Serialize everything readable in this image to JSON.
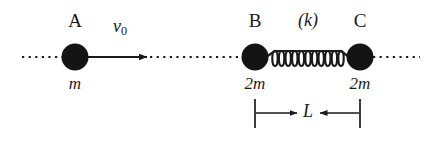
{
  "figure": {
    "type": "physics-mechanics-diagram",
    "background_color": "#ffffff",
    "ink_color": "#1a1a1a"
  },
  "bodies": [
    {
      "id": "A",
      "name_label": "A",
      "mass_label": "m",
      "cx": 75,
      "cy": 57,
      "r": 13,
      "name_x": 75,
      "name_y": 20,
      "mass_x": 75,
      "mass_y": 82
    },
    {
      "id": "B",
      "name_label": "B",
      "mass_label": "2m",
      "cx": 255,
      "cy": 57,
      "r": 13,
      "name_x": 255,
      "name_y": 20,
      "mass_x": 255,
      "mass_y": 82
    },
    {
      "id": "C",
      "name_label": "C",
      "mass_label": "2m",
      "cx": 360,
      "cy": 57,
      "r": 13,
      "name_x": 360,
      "name_y": 20,
      "mass_x": 360,
      "mass_y": 82
    }
  ],
  "velocity": {
    "symbol": "v",
    "subscript": "0",
    "label_x": 120,
    "label_y": 26,
    "arrow_start_x": 88,
    "arrow_end_x": 148,
    "arrow_y": 57
  },
  "spring": {
    "label": "(k)",
    "label_x": 308,
    "label_y": 20,
    "start_x": 268,
    "end_x": 347,
    "y": 57,
    "coils": 11,
    "amplitude": 8
  },
  "axis": {
    "y": 57,
    "left_x": 22,
    "right_x": 420,
    "style": "dotted"
  },
  "dimension": {
    "label": "L",
    "label_x": 308,
    "label_y": 106,
    "line_y": 113,
    "left_tick_x": 255,
    "right_tick_x": 360,
    "tick_top": 98,
    "tick_bottom": 128,
    "arrow_direction": "inward"
  }
}
